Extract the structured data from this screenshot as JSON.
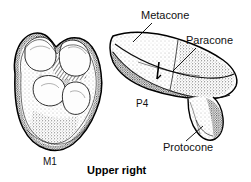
{
  "figure": {
    "caption": "Upper right",
    "background_color": "#ffffff",
    "ink_color": "#111111"
  },
  "labels": {
    "metacone": "Metacone",
    "paracone": "Paracone",
    "protocone": "Protocone",
    "p4": "P4",
    "m1": "M1"
  },
  "specimens": [
    {
      "id": "m1",
      "name": "M1",
      "description": "upper right first molar, occlusal view"
    },
    {
      "id": "p4",
      "name": "P4",
      "description": "upper right fourth premolar, occlusal view"
    }
  ],
  "cusps": [
    {
      "name": "Metacone",
      "tooth": "P4"
    },
    {
      "name": "Paracone",
      "tooth": "P4"
    },
    {
      "name": "Protocone",
      "tooth": "P4"
    }
  ]
}
